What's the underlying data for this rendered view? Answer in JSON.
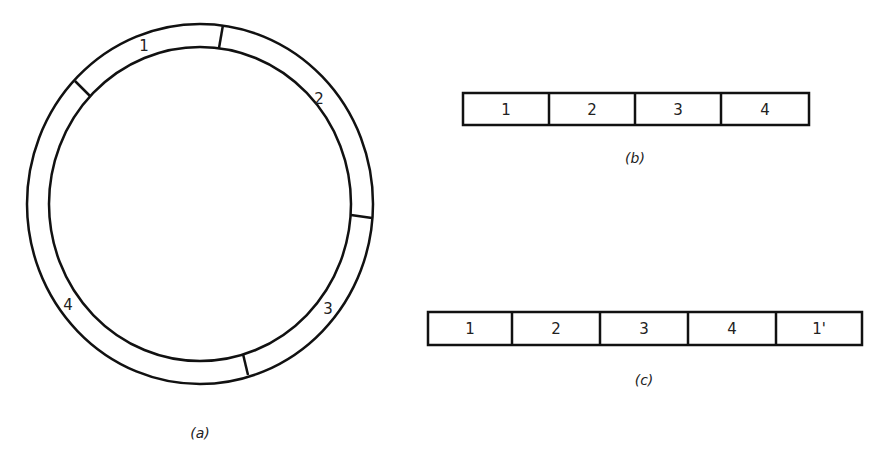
{
  "figure": {
    "panel_a": {
      "caption": "(a)",
      "type": "circular-ring",
      "segments": [
        {
          "label": "1"
        },
        {
          "label": "2"
        },
        {
          "label": "3"
        },
        {
          "label": "4"
        }
      ]
    },
    "panel_b": {
      "caption": "(b)",
      "type": "linear-array",
      "cells": [
        "1",
        "2",
        "3",
        "4"
      ]
    },
    "panel_c": {
      "caption": "(c)",
      "type": "linear-array",
      "cells": [
        "1",
        "2",
        "3",
        "4",
        "1'"
      ]
    }
  },
  "colors": {
    "stroke": "#111111",
    "background": "#ffffff"
  }
}
